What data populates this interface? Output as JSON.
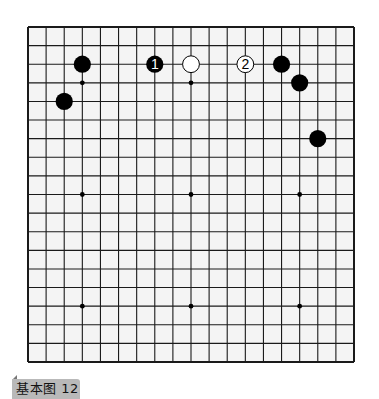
{
  "diagram": {
    "type": "go-board",
    "size": 19,
    "caption": "基本图 12",
    "board": {
      "left": 28,
      "top": 27,
      "right": 354,
      "bottom": 362,
      "line_color": "#1a1a1a",
      "background": "#f4f4f4",
      "star_points": [
        [
          3,
          3
        ],
        [
          9,
          3
        ],
        [
          15,
          3
        ],
        [
          3,
          9
        ],
        [
          9,
          9
        ],
        [
          15,
          9
        ],
        [
          3,
          15
        ],
        [
          9,
          15
        ],
        [
          15,
          15
        ]
      ]
    },
    "stones": [
      {
        "color": "black",
        "col": 3,
        "row": 2,
        "label": ""
      },
      {
        "color": "black",
        "col": 2,
        "row": 4,
        "label": ""
      },
      {
        "color": "black",
        "col": 7,
        "row": 2,
        "label": "1"
      },
      {
        "color": "white",
        "col": 9,
        "row": 2,
        "label": ""
      },
      {
        "color": "white",
        "col": 12,
        "row": 2,
        "label": "2"
      },
      {
        "color": "black",
        "col": 14,
        "row": 2,
        "label": ""
      },
      {
        "color": "black",
        "col": 15,
        "row": 3,
        "label": ""
      },
      {
        "color": "black",
        "col": 16,
        "row": 6,
        "label": ""
      }
    ]
  }
}
